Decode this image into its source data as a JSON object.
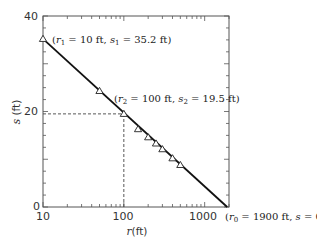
{
  "chart_data": {
    "type": "scatter",
    "title": "",
    "xlabel": "r(ft)",
    "ylabel": "s(ft)",
    "xscale": "log",
    "xlim": [
      10,
      2000
    ],
    "ylim": [
      0,
      40
    ],
    "x_ticks": [
      10,
      100,
      1000
    ],
    "x_tick_labels": [
      "10",
      "100",
      "1000"
    ],
    "y_ticks": [
      0,
      20,
      40
    ],
    "y_tick_labels": [
      "0",
      "20",
      "40"
    ],
    "grid": false,
    "series": [
      {
        "name": "observed drawdown",
        "marker": "triangle",
        "x": [
          10,
          50,
          100,
          150,
          200,
          250,
          300,
          400,
          500
        ],
        "y": [
          35.2,
          24.3,
          19.5,
          16.3,
          14.6,
          13.3,
          12.1,
          10.2,
          8.8
        ]
      },
      {
        "name": "fitted line",
        "type": "line",
        "x": [
          10,
          1900
        ],
        "y": [
          35.2,
          0
        ]
      }
    ],
    "reference_lines": [
      {
        "type": "horizontal-dashed",
        "y": 19.5,
        "x_from": 10,
        "x_to": 100
      },
      {
        "type": "vertical-dashed",
        "x": 100,
        "y_from": 0,
        "y_to": 19.5
      }
    ],
    "annotations": [
      {
        "text": "(r1 = 10 ft, s1 = 35.2 ft)",
        "x": 10,
        "y": 35.2
      },
      {
        "text": "(r2 = 100 ft, s2 = 19.5 ft)",
        "x": 100,
        "y": 19.5
      },
      {
        "text": "(r0 = 1900 ft, s = 0)",
        "x": 1900,
        "y": 0
      }
    ]
  },
  "labels": {
    "xlabel": "r(ft)",
    "ylabel": "s (ft)",
    "xtick_10": "10",
    "xtick_100": "100",
    "xtick_1000": "1000",
    "ytick_0": "0",
    "ytick_20": "20",
    "ytick_40": "40"
  }
}
